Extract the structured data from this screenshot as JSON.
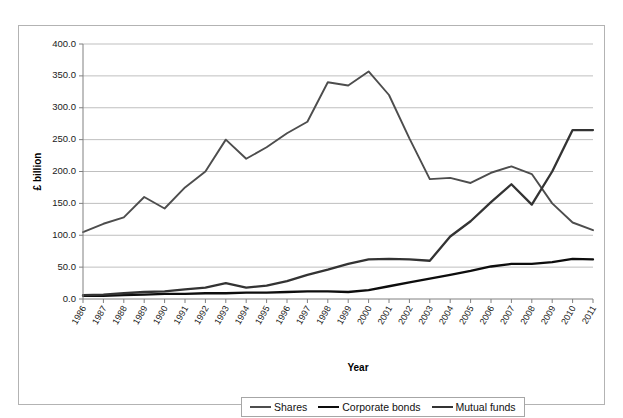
{
  "chart_data": {
    "type": "line",
    "title": "",
    "xlabel": "Year",
    "ylabel": "£ billion",
    "ylim": [
      0,
      400
    ],
    "ytick_step": 50,
    "ytick_labels": [
      "0.0",
      "50.0",
      "100.0",
      "150.0",
      "200.0",
      "250.0",
      "300.0",
      "350.0",
      "400.0"
    ],
    "grid": true,
    "legend_position": "bottom",
    "categories": [
      "1986",
      "1987",
      "1988",
      "1989",
      "1990",
      "1991",
      "1992",
      "1993",
      "1994",
      "1995",
      "1996",
      "1997",
      "1998",
      "1999",
      "2000",
      "2001",
      "2002",
      "2003",
      "2004",
      "2005",
      "2006",
      "2007",
      "2008",
      "2009",
      "2010",
      "2011"
    ],
    "series": [
      {
        "name": "Shares",
        "color": "#4d4d4d",
        "width": 1.9,
        "values": [
          105,
          118,
          128,
          160,
          142,
          175,
          200,
          250,
          220,
          238,
          260,
          278,
          340,
          335,
          357,
          320,
          252,
          188,
          190,
          182,
          198,
          208,
          196,
          150,
          120,
          108
        ]
      },
      {
        "name": "Corporate bonds",
        "color": "#0d0d0d",
        "width": 2.3,
        "values": [
          5,
          5,
          6,
          7,
          8,
          8,
          9,
          9,
          10,
          10,
          11,
          12,
          12,
          11,
          14,
          20,
          26,
          32,
          38,
          44,
          51,
          55,
          55,
          58,
          63,
          62
        ]
      },
      {
        "name": "Mutual funds",
        "color": "#333333",
        "width": 2.3,
        "values": [
          6,
          7,
          9,
          11,
          12,
          15,
          18,
          25,
          18,
          21,
          28,
          38,
          46,
          55,
          62,
          63,
          62,
          60,
          98,
          122,
          152,
          180,
          148,
          200,
          265,
          265
        ]
      }
    ]
  },
  "legend": {
    "items": [
      {
        "label": "Shares"
      },
      {
        "label": "Corporate bonds"
      },
      {
        "label": "Mutual funds"
      }
    ]
  }
}
